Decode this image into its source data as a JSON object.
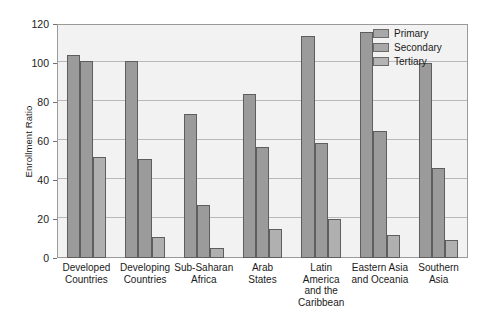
{
  "chart_data": {
    "type": "bar",
    "title": "",
    "xlabel": "",
    "ylabel": "Enrollment Ratio",
    "ylim": [
      0,
      120
    ],
    "yticks": [
      0,
      20,
      40,
      60,
      80,
      100,
      120
    ],
    "grid": true,
    "legend_position": "top-right",
    "categories": [
      "Developed\nCountries",
      "Developing\nCountries",
      "Sub-Saharan\nAfrica",
      "Arab\nStates",
      "Latin\nAmerica\nand the\nCaribbean",
      "Eastern Asia\nand Oceania",
      "Southern\nAsia"
    ],
    "series": [
      {
        "name": "Primary",
        "values": [
          104,
          101,
          74,
          84,
          114,
          116,
          100
        ]
      },
      {
        "name": "Secondary",
        "values": [
          101,
          51,
          27,
          57,
          59,
          65,
          46
        ]
      },
      {
        "name": "Tertiary",
        "values": [
          52,
          11,
          5,
          15,
          20,
          12,
          9
        ]
      }
    ],
    "colors": {
      "primary": "#9b9b9b",
      "secondary": "#9b9b9b",
      "tertiary": "#b0b0b0",
      "bar_border": "#5e5e5e",
      "plot_background": "#f2f2f2",
      "plot_border": "#9a9a9a",
      "grid_line": "#b9b9b9",
      "text": "#1b1b1b"
    }
  }
}
